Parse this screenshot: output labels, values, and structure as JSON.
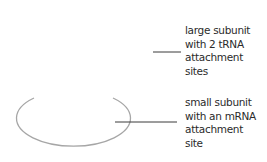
{
  "diagram": {
    "type": "ribosome-structure",
    "colors": {
      "outline": "#a6a6a6",
      "leader": "#3a3a3a",
      "text": "#2b2b2b"
    },
    "labels": [
      {
        "id": "large-subunit",
        "lines": [
          "large subunit",
          "with 2 tRNA",
          "attachment",
          "sites"
        ]
      },
      {
        "id": "small-subunit",
        "lines": [
          "small subunit",
          "with an mRNA",
          "attachment",
          "site"
        ]
      }
    ],
    "shapes": {
      "small_subunit_outline": {
        "shape": "open-ellipse",
        "cx": 73,
        "cy": 125,
        "rx": 57,
        "ry": 28
      }
    }
  }
}
